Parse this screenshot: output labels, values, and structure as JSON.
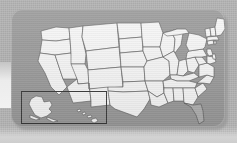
{
  "image": {
    "title": "Map of the United States",
    "subject": "united-states-map",
    "style": "grayscale",
    "panel_label": "map-panel"
  },
  "colors": {
    "outer_background": "#b4b4b4",
    "panel_background": "#9a9a9a",
    "state_fill": "#f7f7f7",
    "state_border": "#555555",
    "highlight_fill": "#b0b0b0",
    "inset_border": "#3b3b3b",
    "bottom_strip": "#d0d0d0"
  },
  "map": {
    "region_label": "contiguous-united-states",
    "state_count": 48,
    "highlighted_states": [
      "Florida"
    ],
    "states": [
      "Washington",
      "Oregon",
      "California",
      "Nevada",
      "Idaho",
      "Montana",
      "Wyoming",
      "Utah",
      "Arizona",
      "Colorado",
      "New Mexico",
      "North Dakota",
      "South Dakota",
      "Nebraska",
      "Kansas",
      "Oklahoma",
      "Texas",
      "Minnesota",
      "Iowa",
      "Missouri",
      "Arkansas",
      "Louisiana",
      "Wisconsin",
      "Illinois",
      "Michigan",
      "Indiana",
      "Ohio",
      "Kentucky",
      "Tennessee",
      "Mississippi",
      "Alabama",
      "Georgia",
      "Florida",
      "South Carolina",
      "North Carolina",
      "Virginia",
      "West Virginia",
      "Pennsylvania",
      "New York",
      "Maryland",
      "Delaware",
      "New Jersey",
      "Connecticut",
      "Rhode Island",
      "Massachusetts",
      "Vermont",
      "New Hampshire",
      "Maine"
    ]
  },
  "inset": {
    "label": "alaska-hawaii-inset",
    "regions": [
      "Alaska",
      "Hawaii"
    ]
  }
}
